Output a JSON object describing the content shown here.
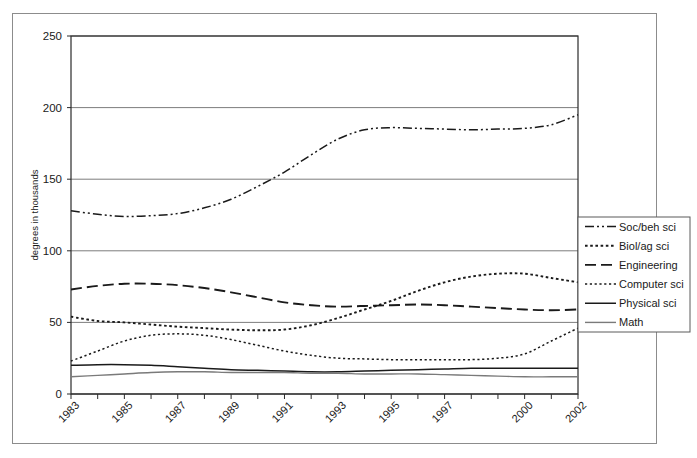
{
  "chart_data": {
    "type": "line",
    "title": "",
    "xlabel": "",
    "ylabel": "degrees in thousands",
    "ylim": [
      0,
      250
    ],
    "yticks": [
      0,
      50,
      100,
      150,
      200,
      250
    ],
    "grid": true,
    "legend_position": "right",
    "x": [
      1983,
      1984,
      1985,
      1986,
      1987,
      1988,
      1989,
      1990,
      1991,
      1992,
      1993,
      1994,
      1995,
      1996,
      1997,
      1998,
      1999,
      2000,
      2001,
      2002
    ],
    "xtick_labels": [
      "1983",
      "1985",
      "1987",
      "1989",
      "1991",
      "1993",
      "1995",
      "1997",
      "2000",
      "2002"
    ],
    "xtick_values": [
      1983,
      1985,
      1987,
      1989,
      1991,
      1993,
      1995,
      1997,
      2000,
      2002
    ],
    "series": [
      {
        "name": "Soc/beh sci",
        "style": "dash-dot-dot",
        "color": "#1a1a1a",
        "values": [
          128,
          125.5,
          124,
          124.5,
          126,
          130,
          136,
          145,
          155,
          167,
          178,
          184.5,
          186,
          185.5,
          185,
          184.5,
          185,
          185.5,
          188,
          195
        ]
      },
      {
        "name": "Biol/ag sci",
        "style": "dotted-medium",
        "color": "#1a1a1a",
        "values": [
          54,
          51,
          50,
          48.5,
          47,
          46,
          45,
          44.5,
          45,
          48,
          53,
          59,
          65,
          72,
          78,
          82,
          84,
          84,
          81,
          78
        ]
      },
      {
        "name": "Engineering",
        "style": "long-dash",
        "color": "#1a1a1a",
        "values": [
          73,
          75.5,
          77,
          77,
          76,
          74,
          71,
          67.5,
          64,
          62,
          61,
          61.5,
          62,
          62.5,
          62,
          61,
          60,
          59,
          58.5,
          59
        ]
      },
      {
        "name": "Computer sci",
        "style": "dotted-fine",
        "color": "#1a1a1a",
        "values": [
          23,
          30,
          37,
          41,
          42,
          41,
          38,
          34,
          30,
          27,
          25,
          24.5,
          24,
          24,
          24,
          24,
          25,
          28,
          37,
          46
        ]
      },
      {
        "name": "Physical sci",
        "style": "solid-dark",
        "color": "#1a1a1a",
        "values": [
          20,
          20.5,
          20.5,
          20,
          19,
          18,
          17,
          16.5,
          16,
          15.5,
          15.5,
          16,
          16.5,
          17,
          17.5,
          18,
          18,
          18,
          18,
          18
        ]
      },
      {
        "name": "Math",
        "style": "solid-gray",
        "color": "#7a7a7a",
        "values": [
          12,
          13,
          14,
          15,
          15.5,
          15.5,
          15,
          15,
          15,
          14.5,
          14.5,
          14,
          14,
          14,
          13.5,
          13,
          12.5,
          12,
          12,
          12
        ]
      }
    ]
  },
  "legend": {
    "items": [
      {
        "label": "Soc/beh sci"
      },
      {
        "label": "Biol/ag sci"
      },
      {
        "label": "Engineering"
      },
      {
        "label": "Computer sci"
      },
      {
        "label": "Physical sci"
      },
      {
        "label": "Math"
      }
    ]
  }
}
